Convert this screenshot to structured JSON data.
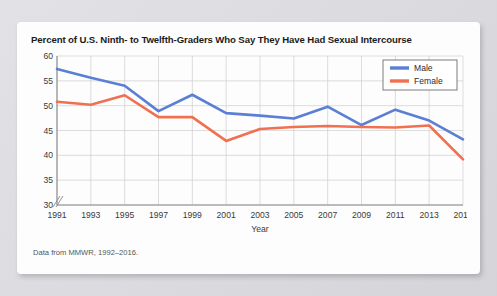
{
  "card": {
    "title": "Percent of U.S. Ninth- to Twelfth-Graders Who Say They Have Had Sexual Intercourse",
    "footnote": "Data from MMWR, 1992–2016."
  },
  "colors": {
    "male": "#5B7FD4",
    "female": "#F07050",
    "grid": "#cfcfcf",
    "axis": "#8a8a8a",
    "card_bg": "#fdfdfd",
    "page_bg": "#d9d9dd"
  },
  "chart_data": {
    "type": "line",
    "title": "Percent of U.S. Ninth- to Twelfth-Graders Who Say They Have Had Sexual Intercourse",
    "xlabel": "Year",
    "ylabel": "",
    "x": [
      1991,
      1993,
      1995,
      1997,
      1999,
      2001,
      2003,
      2005,
      2007,
      2009,
      2011,
      2013,
      2015
    ],
    "xticklabels": [
      "1991",
      "1993",
      "1995",
      "1997",
      "1999",
      "2001",
      "2003",
      "2005",
      "2007",
      "2009",
      "2011",
      "2013",
      "2015"
    ],
    "yticks": [
      30,
      35,
      40,
      45,
      50,
      55,
      60
    ],
    "yticklabels": [
      "30",
      "35",
      "40",
      "45",
      "50",
      "55",
      "60"
    ],
    "ylim": [
      30,
      60
    ],
    "xlim": [
      1991,
      2015
    ],
    "axis_break": true,
    "grid": true,
    "legend_position": "top-right",
    "series": [
      {
        "name": "Male",
        "color": "#5B7FD4",
        "values": [
          57.4,
          55.6,
          54.0,
          48.9,
          52.2,
          48.5,
          48.0,
          47.4,
          49.8,
          46.1,
          49.2,
          47.0,
          43.2
        ]
      },
      {
        "name": "Female",
        "color": "#F07050",
        "values": [
          50.8,
          50.2,
          52.1,
          47.7,
          47.7,
          42.9,
          45.3,
          45.7,
          45.9,
          45.7,
          45.6,
          46.0,
          39.2
        ]
      }
    ]
  }
}
